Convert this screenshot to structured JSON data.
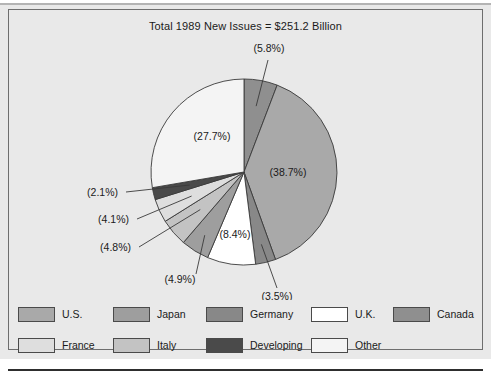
{
  "chart_data": {
    "type": "pie",
    "title": "Total 1989 New Issues = $251.2 Billion",
    "total_label": "Total 1989 New Issues = $251.2 Billion",
    "total_value": 251.2,
    "total_units": "Billion",
    "currency": "$",
    "year": 1989,
    "legend_position": "bottom",
    "grid": false,
    "xlabel": "",
    "ylabel": "",
    "categories": [
      "Canada",
      "U.S.",
      "Germany",
      "U.K.",
      "Japan",
      "Italy",
      "France",
      "Developing",
      "Other"
    ],
    "values": [
      5.8,
      38.7,
      3.5,
      8.4,
      4.9,
      4.8,
      4.1,
      2.1,
      27.7
    ],
    "labels": [
      "(5.8%)",
      "(38.7%)",
      "(3.5%)",
      "(8.4%)",
      "(4.9%)",
      "(4.8%)",
      "(4.1%)",
      "(2.1%)",
      "(27.7%)"
    ],
    "colors": [
      "#8f8f8f",
      "#a9a9a9",
      "#888888",
      "#ffffff",
      "#9e9e9e",
      "#c3c3c3",
      "#dedede",
      "#4a4a4a",
      "#f4f4f4"
    ],
    "slices": [
      {
        "name": "Canada",
        "value": 5.8,
        "label": "(5.8%)",
        "color": "#8f8f8f",
        "label_style": "callout"
      },
      {
        "name": "U.S.",
        "value": 38.7,
        "label": "(38.7%)",
        "color": "#a9a9a9",
        "label_style": "inside"
      },
      {
        "name": "Germany",
        "value": 3.5,
        "label": "(3.5%)",
        "color": "#888888",
        "label_style": "callout"
      },
      {
        "name": "U.K.",
        "value": 8.4,
        "label": "(8.4%)",
        "color": "#ffffff",
        "label_style": "inside"
      },
      {
        "name": "Japan",
        "value": 4.9,
        "label": "(4.9%)",
        "color": "#9e9e9e",
        "label_style": "callout"
      },
      {
        "name": "Italy",
        "value": 4.8,
        "label": "(4.8%)",
        "color": "#c3c3c3",
        "label_style": "callout"
      },
      {
        "name": "France",
        "value": 4.1,
        "label": "(4.1%)",
        "color": "#dedede",
        "label_style": "callout"
      },
      {
        "name": "Developing",
        "value": 2.1,
        "label": "(2.1%)",
        "color": "#4a4a4a",
        "label_style": "callout"
      },
      {
        "name": "Other",
        "value": 27.7,
        "label": "(27.7%)",
        "color": "#f4f4f4",
        "label_style": "inside"
      }
    ]
  },
  "title": {
    "text": "Total 1989 New Issues = $251.2 Billion"
  },
  "pie_labels": {
    "canada": "(5.8%)",
    "us": "(38.7%)",
    "germany": "(3.5%)",
    "uk": "(8.4%)",
    "japan": "(4.9%)",
    "italy": "(4.8%)",
    "france": "(4.1%)",
    "developing": "(2.1%)",
    "other": "(27.7%)"
  },
  "legend": {
    "row1": [
      {
        "label": "U.S.",
        "color": "#a9a9a9"
      },
      {
        "label": "Japan",
        "color": "#9e9e9e"
      },
      {
        "label": "Germany",
        "color": "#888888"
      },
      {
        "label": "U.K.",
        "color": "#ffffff"
      },
      {
        "label": "Canada",
        "color": "#8f8f8f"
      }
    ],
    "row2": [
      {
        "label": "France",
        "color": "#dedede"
      },
      {
        "label": "Italy",
        "color": "#c3c3c3"
      },
      {
        "label": "Developing",
        "color": "#4a4a4a"
      },
      {
        "label": "Other",
        "color": "#f4f4f4"
      }
    ]
  },
  "colors": {
    "background": "#e9e9e9",
    "frame": "#6e6e6e",
    "text": "#1a1a1a",
    "rule": "#2e2e2e"
  }
}
